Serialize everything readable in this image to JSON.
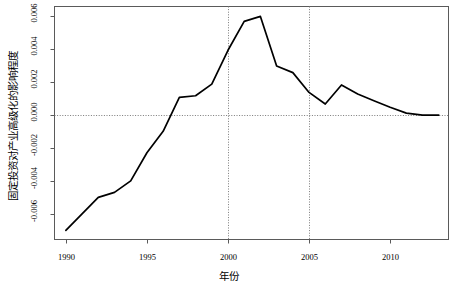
{
  "chart_data": {
    "type": "line",
    "title": "",
    "xlabel": "年份",
    "ylabel": "固定投资对产业高级化的影响程度",
    "xlim": [
      1989.3,
      2013.6
    ],
    "ylim": [
      -0.00755,
      0.00655
    ],
    "xticks": [
      1990,
      1995,
      2000,
      2005,
      2010
    ],
    "xticklabels": [
      "1990",
      "1995",
      "2000",
      "2005",
      "2010"
    ],
    "yticks": [
      -0.006,
      -0.004,
      -0.002,
      0.0,
      0.002,
      0.004,
      0.006
    ],
    "yticklabels": [
      "-0.006",
      "-0.004",
      "-0.002",
      "0.000",
      "0.002",
      "0.004",
      "0.006"
    ],
    "grid": false,
    "reference_lines": [
      {
        "orientation": "horizontal",
        "value": 0.0,
        "style": "dotted"
      },
      {
        "orientation": "vertical",
        "value": 2000,
        "style": "dotted"
      },
      {
        "orientation": "vertical",
        "value": 2005,
        "style": "dotted"
      }
    ],
    "legend": null,
    "line_color": "#000000",
    "series": [
      {
        "name": "固定投资对产业高级化的影响程度",
        "x": [
          1990,
          1991,
          1992,
          1993,
          1994,
          1995,
          1996,
          1997,
          1998,
          1999,
          2000,
          2001,
          2002,
          2003,
          2004,
          2005,
          2006,
          2007,
          2008,
          2009,
          2010,
          2011,
          2012,
          2013
        ],
        "values": [
          -0.007,
          -0.006,
          -0.005,
          -0.0047,
          -0.004,
          -0.0023,
          -0.001,
          0.00105,
          0.00115,
          0.00185,
          0.0039,
          0.00565,
          0.00595,
          0.00295,
          0.00255,
          0.00135,
          0.00065,
          0.0018,
          0.00125,
          0.00085,
          0.00045,
          0.0001,
          -2e-05,
          -2e-05
        ]
      }
    ]
  },
  "axes": {
    "xtick_positions_px": [
      62,
      141,
      221,
      300,
      380
    ],
    "ytick_positions_px": [
      211,
      178,
      145,
      112,
      79,
      46,
      13
    ]
  }
}
